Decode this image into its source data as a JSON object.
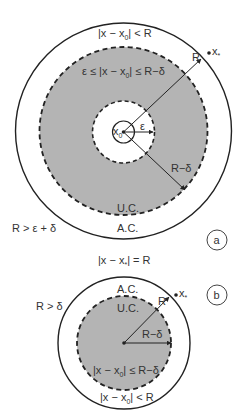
{
  "colors": {
    "shade": "#b4b4b4",
    "stroke": "#222222",
    "text": "#333333",
    "background": "#ffffff"
  },
  "panel_a": {
    "tag": "a",
    "outer_label": "|x − x",
    "outer_label_sub": "0",
    "outer_label_tail": "| < R",
    "annulus_label_pre": "ε ≤ |x − x",
    "annulus_label_sub": "0",
    "annulus_label_tail": "| ≤ R−δ",
    "center_label": "x",
    "center_label_sub": "0",
    "epsilon_label": "ε",
    "r_label": "R",
    "r_minus_delta_label": "R−δ",
    "uc_label": "U.C.",
    "ac_label": "A.C.",
    "condition": "R > ε + δ",
    "xstar_label": "x",
    "xstar_sub": "*"
  },
  "middle_label": {
    "pre": "|x − x",
    "sub": "*",
    "tail": "| = R"
  },
  "panel_b": {
    "tag": "b",
    "ac_label": "A.C.",
    "uc_label": "U.C.",
    "r_label": "R",
    "r_minus_delta_label": "R−δ",
    "inner_label_pre": "|x − x",
    "inner_label_sub": "0",
    "inner_label_tail": "| ≤ R−δ",
    "outer_label_pre": "|x − x",
    "outer_label_sub": "0",
    "outer_label_tail": "| < R",
    "condition": "R > δ",
    "xstar_label": "x",
    "xstar_sub": "*"
  }
}
